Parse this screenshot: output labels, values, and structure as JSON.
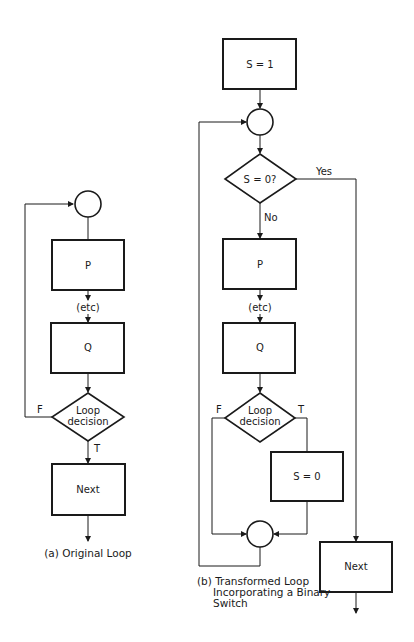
{
  "diagram_a": {
    "caption": "(a) Original Loop",
    "box_p": "P",
    "etc": "(etc)",
    "box_q": "Q",
    "decision_line1": "Loop",
    "decision_line2": "decision",
    "false_label": "F",
    "true_label": "T",
    "box_next": "Next"
  },
  "diagram_b": {
    "caption_line1": "(b) Transformed Loop",
    "caption_line2": "Incorporating a Binary",
    "caption_line3": "Switch",
    "box_init": "S = 1",
    "switch_test": "S = 0?",
    "yes_label": "Yes",
    "no_label": "No",
    "box_p": "P",
    "etc": "(etc)",
    "box_q": "Q",
    "decision_line1": "Loop",
    "decision_line2": "decision",
    "false_label": "F",
    "true_label": "T",
    "box_reset": "S = 0",
    "box_next": "Next"
  },
  "colors": {
    "ink": "#1a1a1a",
    "background": "#ffffff"
  }
}
